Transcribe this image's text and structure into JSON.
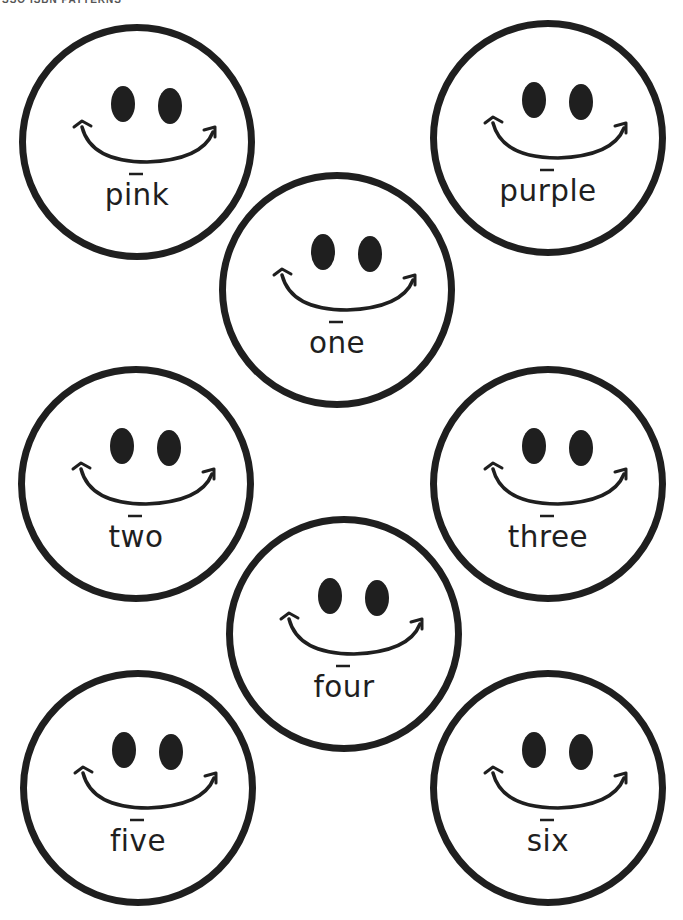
{
  "page": {
    "header_text": "SSO ISBN PATTERNS",
    "ink_color": "#1f1f1f",
    "background_color": "#ffffff"
  },
  "faces": [
    {
      "word": "pink",
      "center": [
        137,
        142
      ]
    },
    {
      "word": "purple",
      "center": [
        548,
        138
      ]
    },
    {
      "word": "one",
      "center": [
        337,
        290
      ]
    },
    {
      "word": "two",
      "center": [
        136,
        484
      ]
    },
    {
      "word": "three",
      "center": [
        548,
        484
      ]
    },
    {
      "word": "four",
      "center": [
        344,
        634
      ]
    },
    {
      "word": "five",
      "center": [
        138,
        788
      ]
    },
    {
      "word": "six",
      "center": [
        548,
        788
      ]
    }
  ]
}
